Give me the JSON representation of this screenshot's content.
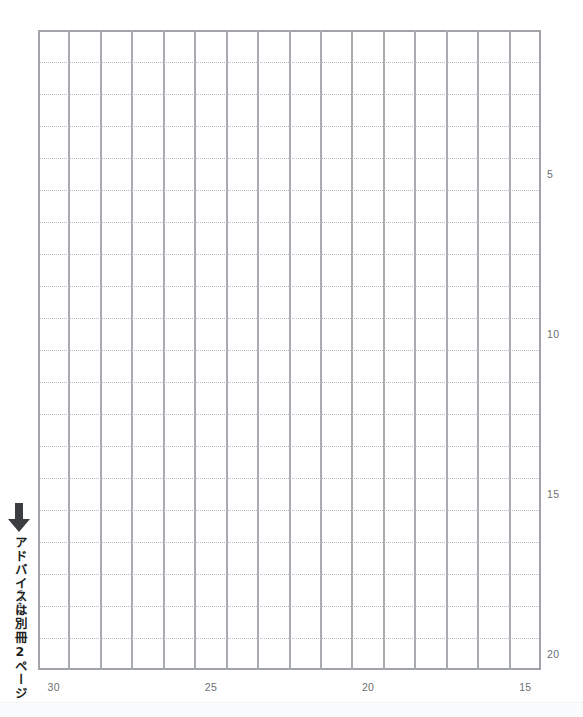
{
  "sheet": {
    "kind": "japanese-manuscript-grid",
    "columns": 16,
    "rows": 20,
    "grid_line_color": "#a8abaf",
    "row_line_color": "#b9bcc0",
    "background_color": "#ffffff"
  },
  "annotation": {
    "arrow_icon": "down-arrow-icon",
    "text": "アドバイスは別冊2ページ",
    "ruby": "べっさつ",
    "color": "#1d1f21"
  },
  "axes": {
    "row_markers": [
      {
        "label": "5",
        "row": 5
      },
      {
        "label": "10",
        "row": 10
      },
      {
        "label": "15",
        "row": 15
      },
      {
        "label": "20",
        "row": 20
      }
    ],
    "column_markers": [
      {
        "label": "30",
        "col": 1
      },
      {
        "label": "25",
        "col": 6
      },
      {
        "label": "20",
        "col": 11
      },
      {
        "label": "15",
        "col": 16
      }
    ],
    "label_color": "#6b6f74"
  }
}
